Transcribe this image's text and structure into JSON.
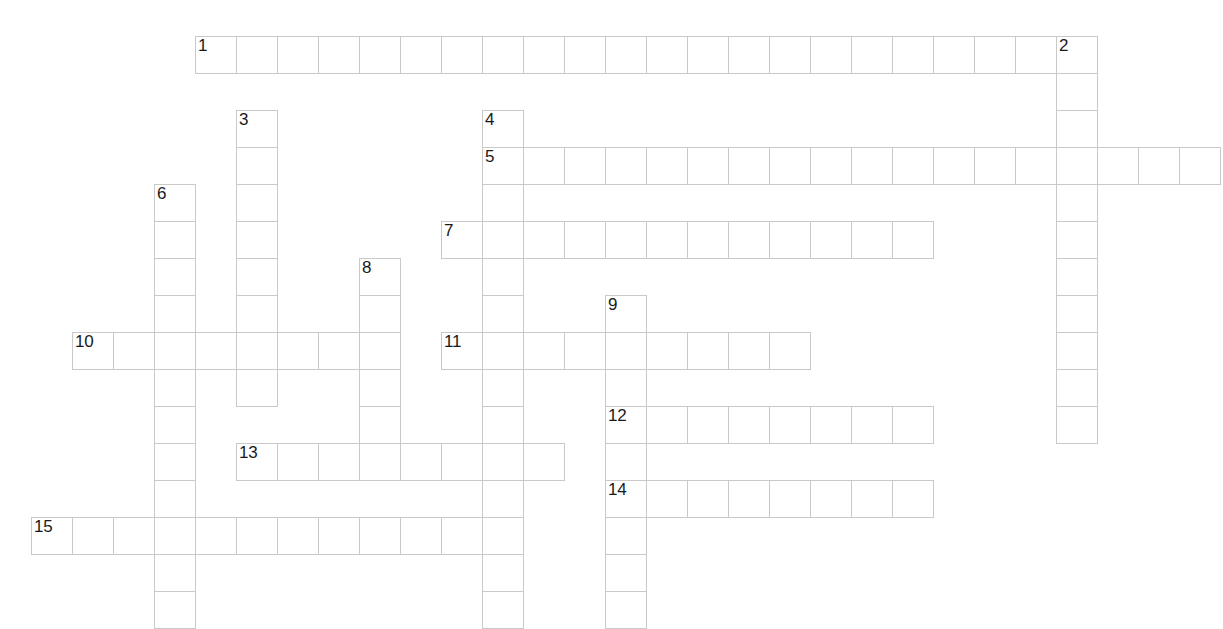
{
  "puzzle": {
    "title": "Crossword Puzzle Grid",
    "type": "crossword-grid",
    "grid": {
      "cell_width": 41,
      "cell_height": 37,
      "origin_x": 31,
      "origin_y": 36,
      "columns": 29,
      "rows": 16,
      "cell_border_color": "#c9c9c9",
      "cell_fill_color": "#ffffff",
      "number_color": "#1a1a1a",
      "background_color": "#ffffff"
    },
    "entries": [
      {
        "number": "1",
        "direction": "across",
        "col": 4,
        "row": 0,
        "length": 22
      },
      {
        "number": "2",
        "direction": "down",
        "col": 25,
        "row": 0,
        "length": 11
      },
      {
        "number": "3",
        "direction": "down",
        "col": 5,
        "row": 2,
        "length": 8
      },
      {
        "number": "4",
        "direction": "down",
        "col": 11,
        "row": 2,
        "length": 14
      },
      {
        "number": "5",
        "direction": "across",
        "col": 11,
        "row": 3,
        "length": 18
      },
      {
        "number": "6",
        "direction": "down",
        "col": 3,
        "row": 4,
        "length": 12
      },
      {
        "number": "7",
        "direction": "across",
        "col": 10,
        "row": 5,
        "length": 12
      },
      {
        "number": "8",
        "direction": "down",
        "col": 8,
        "row": 6,
        "length": 6
      },
      {
        "number": "9",
        "direction": "down",
        "col": 14,
        "row": 7,
        "length": 9
      },
      {
        "number": "10",
        "direction": "across",
        "col": 1,
        "row": 8,
        "length": 8
      },
      {
        "number": "11",
        "direction": "across",
        "col": 10,
        "row": 8,
        "length": 9
      },
      {
        "number": "12",
        "direction": "across",
        "col": 14,
        "row": 10,
        "length": 8
      },
      {
        "number": "13",
        "direction": "across",
        "col": 5,
        "row": 11,
        "length": 8
      },
      {
        "number": "14",
        "direction": "across",
        "col": 14,
        "row": 12,
        "length": 8
      },
      {
        "number": "15",
        "direction": "across",
        "col": 0,
        "row": 13,
        "length": 11
      }
    ],
    "letters": {}
  }
}
